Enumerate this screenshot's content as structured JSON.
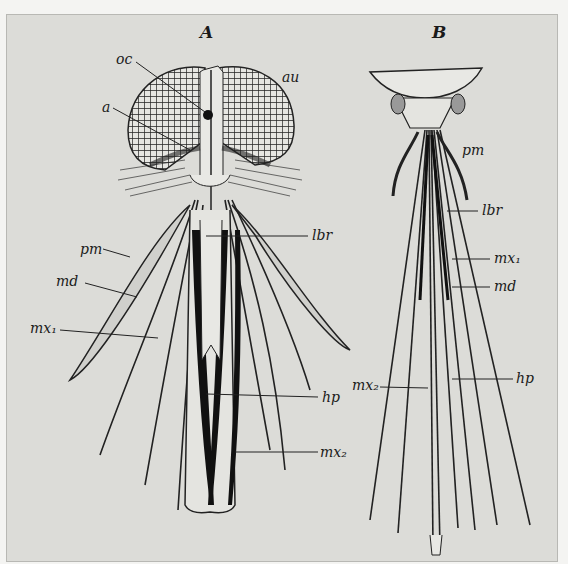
{
  "figure": {
    "panels": [
      {
        "id": "A",
        "label": "A",
        "parts": {
          "oc": "oc",
          "au": "au",
          "a": "a",
          "pm": "pm",
          "md": "md",
          "mx1": "mx₁",
          "lbr": "lbr",
          "hp": "hp",
          "mx2": "mx₂"
        }
      },
      {
        "id": "B",
        "label": "B",
        "parts": {
          "pm": "pm",
          "lbr": "lbr",
          "mx1": "mx₁",
          "md": "md",
          "mx2": "mx₂",
          "hp": "hp"
        }
      }
    ],
    "colors": {
      "background": "#dcdcd8",
      "ink": "#1a1a1a"
    }
  }
}
